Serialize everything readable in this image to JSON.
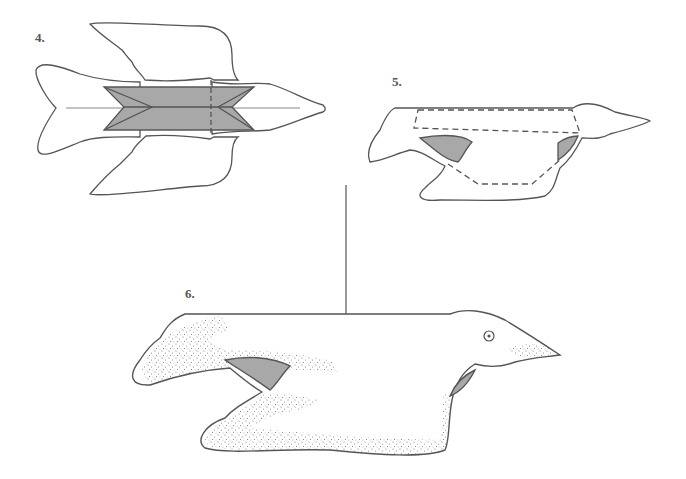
{
  "diagram": {
    "steps": [
      {
        "label": "4.",
        "description": "Top view: flat bird outline with folded gray center body panel, dashed fold line near head"
      },
      {
        "label": "5.",
        "description": "Side view: bird shape with dashed fold outline and gray wing underside"
      },
      {
        "label": "6.",
        "description": "Finished bird hanging from a string, stippled shading, eye on head"
      }
    ],
    "colors": {
      "outline": "#555555",
      "fill_gray": "#a8a8a8",
      "stipple": "#777777",
      "background": "#ffffff"
    }
  }
}
